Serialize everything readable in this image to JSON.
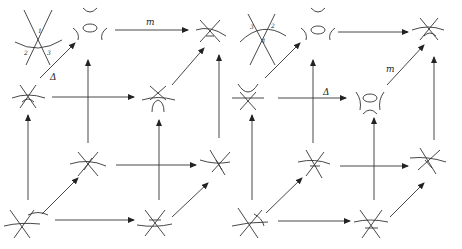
{
  "diagram": {
    "type": "commutative cube diagrams of tangle/knot resolutions",
    "cubes": [
      {
        "id": "left",
        "crossing_labels": [
          "1",
          "2",
          "3"
        ],
        "edge_labels": {
          "top_edge": "m",
          "diagonal_edge": "Δ"
        }
      },
      {
        "id": "right",
        "crossing_labels": [
          "3",
          "2",
          "1"
        ],
        "edge_labels": {
          "diagonal_edge": "m",
          "middle_edge": "Δ"
        }
      }
    ],
    "colors": {
      "stroke": "#222222",
      "background": "#ffffff"
    }
  }
}
